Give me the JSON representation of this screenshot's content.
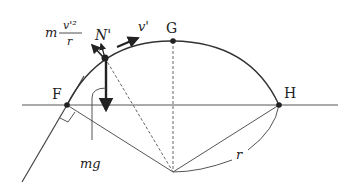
{
  "diagram": {
    "type": "physics-free-body",
    "points": {
      "F": {
        "label": "F"
      },
      "G": {
        "label": "G"
      },
      "H": {
        "label": "H"
      }
    },
    "forces": {
      "centripetal": {
        "label_num": "v'²",
        "label_prefix": "m",
        "label_den": "r"
      },
      "normal": {
        "label": "N'"
      },
      "velocity": {
        "label": "v'"
      },
      "gravity": {
        "label": "mg"
      }
    },
    "radius": {
      "label": "r"
    },
    "colors": {
      "stroke": "#333333",
      "fill": "#222222"
    }
  }
}
